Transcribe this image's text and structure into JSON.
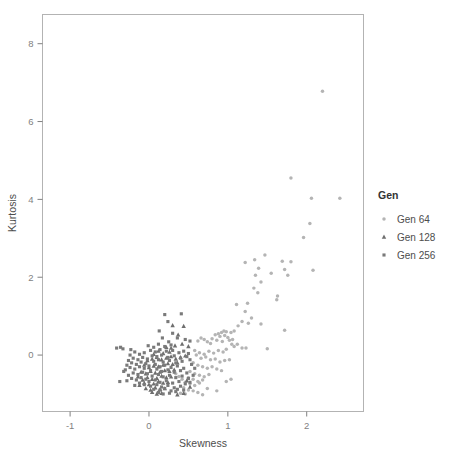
{
  "chart_data": {
    "type": "scatter",
    "title": "",
    "xlabel": "Skewness",
    "ylabel": "Kurtosis",
    "xlim": [
      -1.35,
      2.72
    ],
    "ylim": [
      -1.45,
      8.75
    ],
    "xticks": [
      -1,
      0,
      1,
      2
    ],
    "xticklabels": [
      "-1",
      "0",
      "1",
      "2"
    ],
    "yticks": [
      0,
      2,
      4,
      6,
      8
    ],
    "yticklabels": [
      "0",
      "2",
      "4",
      "6",
      "8"
    ],
    "grid": false,
    "legend": {
      "title": "Gen",
      "position": "right",
      "entries": [
        {
          "name": "Gen 64",
          "marker": "circle",
          "color": "#b4b4b4"
        },
        {
          "name": "Gen 128",
          "marker": "triangle",
          "color": "#6e6e6e"
        },
        {
          "name": "Gen 256",
          "marker": "square",
          "color": "#7a7a7a"
        }
      ]
    },
    "series": [
      {
        "name": "Gen 64",
        "marker": "circle",
        "color": "#b4b4b4",
        "points": [
          [
            2.2,
            6.78
          ],
          [
            1.8,
            4.55
          ],
          [
            2.06,
            4.03
          ],
          [
            2.42,
            4.03
          ],
          [
            2.04,
            3.38
          ],
          [
            1.96,
            3.02
          ],
          [
            2.08,
            2.18
          ],
          [
            1.47,
            2.57
          ],
          [
            1.34,
            2.45
          ],
          [
            1.22,
            2.38
          ],
          [
            1.69,
            2.41
          ],
          [
            1.8,
            2.4
          ],
          [
            1.72,
            2.2
          ],
          [
            1.76,
            2.05
          ],
          [
            1.39,
            2.23
          ],
          [
            1.35,
            2.05
          ],
          [
            1.55,
            2.1
          ],
          [
            1.42,
            1.88
          ],
          [
            1.33,
            1.72
          ],
          [
            1.38,
            1.6
          ],
          [
            1.63,
            1.52
          ],
          [
            1.62,
            1.42
          ],
          [
            1.11,
            1.3
          ],
          [
            1.25,
            1.33
          ],
          [
            1.22,
            1.12
          ],
          [
            1.3,
            0.95
          ],
          [
            1.26,
            0.82
          ],
          [
            1.42,
            0.8
          ],
          [
            1.18,
            0.86
          ],
          [
            1.13,
            0.75
          ],
          [
            1.72,
            0.64
          ],
          [
            1.08,
            0.62
          ],
          [
            1.04,
            0.58
          ],
          [
            0.98,
            0.6
          ],
          [
            0.95,
            0.62
          ],
          [
            0.92,
            0.58
          ],
          [
            0.88,
            0.55
          ],
          [
            0.84,
            0.52
          ],
          [
            0.9,
            0.48
          ],
          [
            0.96,
            0.5
          ],
          [
            1.0,
            0.45
          ],
          [
            1.02,
            0.38
          ],
          [
            1.06,
            0.4
          ],
          [
            0.93,
            0.35
          ],
          [
            0.86,
            0.38
          ],
          [
            0.8,
            0.42
          ],
          [
            0.78,
            0.3
          ],
          [
            0.74,
            0.34
          ],
          [
            0.7,
            0.4
          ],
          [
            0.66,
            0.44
          ],
          [
            0.62,
            0.36
          ],
          [
            1.05,
            0.28
          ],
          [
            1.08,
            0.22
          ],
          [
            1.12,
            0.28
          ],
          [
            1.18,
            0.18
          ],
          [
            1.23,
            0.18
          ],
          [
            1.5,
            0.16
          ],
          [
            0.98,
            0.15
          ],
          [
            0.94,
            0.08
          ],
          [
            0.88,
            0.12
          ],
          [
            0.82,
            0.05
          ],
          [
            0.76,
            0.1
          ],
          [
            0.7,
            0.02
          ],
          [
            0.64,
            0.06
          ],
          [
            0.58,
            0.12
          ],
          [
            0.6,
            0.0
          ],
          [
            0.66,
            -0.08
          ],
          [
            0.72,
            -0.05
          ],
          [
            0.78,
            -0.12
          ],
          [
            0.84,
            -0.1
          ],
          [
            0.9,
            -0.18
          ],
          [
            0.96,
            -0.14
          ],
          [
            1.02,
            -0.12
          ],
          [
            0.56,
            -0.2
          ],
          [
            0.62,
            -0.26
          ],
          [
            0.68,
            -0.3
          ],
          [
            0.74,
            -0.34
          ],
          [
            0.8,
            -0.3
          ],
          [
            0.86,
            -0.36
          ],
          [
            0.92,
            -0.4
          ],
          [
            0.52,
            -0.42
          ],
          [
            0.58,
            -0.48
          ],
          [
            0.64,
            -0.52
          ],
          [
            0.7,
            -0.56
          ],
          [
            0.76,
            -0.5
          ],
          [
            0.5,
            -0.58
          ],
          [
            0.56,
            -0.62
          ],
          [
            0.62,
            -0.68
          ],
          [
            0.68,
            -0.64
          ],
          [
            0.46,
            -0.7
          ],
          [
            0.52,
            -0.74
          ],
          [
            0.58,
            -0.78
          ],
          [
            0.64,
            -0.72
          ],
          [
            0.44,
            -0.84
          ],
          [
            0.5,
            -0.9
          ],
          [
            0.56,
            -0.92
          ],
          [
            0.62,
            -0.96
          ],
          [
            0.4,
            -0.98
          ],
          [
            0.46,
            -1.0
          ],
          [
            0.68,
            -1.02
          ],
          [
            0.74,
            -0.86
          ],
          [
            0.86,
            -0.92
          ],
          [
            0.98,
            -0.68
          ],
          [
            1.04,
            -0.62
          ],
          [
            0.42,
            -0.62
          ],
          [
            0.38,
            -0.55
          ],
          [
            0.34,
            -0.48
          ]
        ]
      },
      {
        "name": "Gen 128",
        "marker": "triangle",
        "color": "#6e6e6e",
        "points": [
          [
            0.3,
            0.76
          ],
          [
            0.44,
            0.74
          ],
          [
            0.37,
            0.52
          ],
          [
            0.42,
            0.28
          ],
          [
            0.5,
            0.22
          ],
          [
            0.33,
            0.24
          ],
          [
            0.28,
            0.18
          ],
          [
            0.22,
            0.2
          ],
          [
            0.46,
            -0.02
          ],
          [
            0.4,
            -0.06
          ],
          [
            0.34,
            -0.1
          ],
          [
            0.28,
            -0.04
          ],
          [
            0.22,
            -0.08
          ],
          [
            0.16,
            -0.12
          ],
          [
            0.1,
            -0.06
          ],
          [
            0.04,
            -0.1
          ],
          [
            -0.02,
            -0.14
          ],
          [
            0.36,
            -0.2
          ],
          [
            0.3,
            -0.24
          ],
          [
            0.24,
            -0.22
          ],
          [
            0.18,
            -0.26
          ],
          [
            0.12,
            -0.3
          ],
          [
            0.06,
            -0.28
          ],
          [
            0.0,
            -0.32
          ],
          [
            -0.06,
            -0.26
          ],
          [
            0.32,
            -0.38
          ],
          [
            0.26,
            -0.42
          ],
          [
            0.2,
            -0.4
          ],
          [
            0.14,
            -0.44
          ],
          [
            0.08,
            -0.46
          ],
          [
            0.02,
            -0.42
          ],
          [
            -0.04,
            -0.48
          ],
          [
            -0.1,
            -0.44
          ],
          [
            0.28,
            -0.56
          ],
          [
            0.22,
            -0.58
          ],
          [
            0.16,
            -0.54
          ],
          [
            0.1,
            -0.6
          ],
          [
            0.04,
            -0.62
          ],
          [
            -0.02,
            -0.58
          ],
          [
            -0.08,
            -0.64
          ],
          [
            -0.14,
            -0.56
          ],
          [
            0.24,
            -0.7
          ],
          [
            0.18,
            -0.72
          ],
          [
            0.12,
            -0.68
          ],
          [
            0.06,
            -0.74
          ],
          [
            0.0,
            -0.76
          ],
          [
            -0.06,
            -0.72
          ],
          [
            -0.12,
            -0.78
          ],
          [
            0.2,
            -0.86
          ],
          [
            0.14,
            -0.88
          ],
          [
            0.08,
            -0.84
          ],
          [
            0.02,
            -0.9
          ],
          [
            -0.04,
            -0.86
          ],
          [
            0.16,
            -0.98
          ],
          [
            0.1,
            -1.0
          ],
          [
            0.04,
            -0.96
          ],
          [
            0.36,
            -1.02
          ],
          [
            0.44,
            -0.98
          ],
          [
            0.52,
            -0.82
          ],
          [
            0.48,
            -0.66
          ],
          [
            0.26,
            0.08
          ],
          [
            0.18,
            0.04
          ],
          [
            0.12,
            0.1
          ],
          [
            0.06,
            0.02
          ]
        ]
      },
      {
        "name": "Gen 256",
        "marker": "square",
        "color": "#7a7a7a",
        "points": [
          [
            0.2,
            1.04
          ],
          [
            0.41,
            1.06
          ],
          [
            0.24,
            0.86
          ],
          [
            0.13,
            0.62
          ],
          [
            0.3,
            0.56
          ],
          [
            0.17,
            0.44
          ],
          [
            0.36,
            0.44
          ],
          [
            0.25,
            0.34
          ],
          [
            0.28,
            0.26
          ],
          [
            0.2,
            0.22
          ],
          [
            0.12,
            0.28
          ],
          [
            0.46,
            0.4
          ],
          [
            0.52,
            0.36
          ],
          [
            0.06,
            0.2
          ],
          [
            -0.01,
            0.24
          ],
          [
            -0.33,
            0.16
          ],
          [
            -0.41,
            0.18
          ],
          [
            -0.23,
            0.14
          ],
          [
            -0.36,
            0.2
          ],
          [
            0.02,
            0.12
          ],
          [
            0.08,
            0.08
          ],
          [
            0.14,
            0.14
          ],
          [
            0.22,
            0.1
          ],
          [
            0.3,
            0.12
          ],
          [
            0.38,
            0.06
          ],
          [
            0.44,
            0.1
          ],
          [
            0.5,
            0.04
          ],
          [
            -0.06,
            0.06
          ],
          [
            -0.12,
            0.02
          ],
          [
            -0.18,
            0.08
          ],
          [
            -0.24,
            0.0
          ],
          [
            0.04,
            -0.02
          ],
          [
            0.1,
            -0.04
          ],
          [
            0.16,
            0.0
          ],
          [
            0.24,
            -0.06
          ],
          [
            0.32,
            -0.02
          ],
          [
            0.4,
            -0.08
          ],
          [
            0.48,
            -0.04
          ],
          [
            -0.02,
            -0.1
          ],
          [
            -0.08,
            -0.06
          ],
          [
            -0.14,
            -0.12
          ],
          [
            -0.2,
            -0.08
          ],
          [
            -0.26,
            -0.14
          ],
          [
            0.06,
            -0.16
          ],
          [
            0.12,
            -0.12
          ],
          [
            0.18,
            -0.18
          ],
          [
            0.26,
            -0.14
          ],
          [
            0.34,
            -0.2
          ],
          [
            0.42,
            -0.16
          ],
          [
            0.52,
            -0.12
          ],
          [
            -0.04,
            -0.22
          ],
          [
            -0.1,
            -0.18
          ],
          [
            -0.16,
            -0.24
          ],
          [
            -0.22,
            -0.2
          ],
          [
            -0.28,
            -0.26
          ],
          [
            0.0,
            -0.28
          ],
          [
            0.08,
            -0.24
          ],
          [
            0.14,
            -0.3
          ],
          [
            0.2,
            -0.26
          ],
          [
            0.28,
            -0.32
          ],
          [
            0.36,
            -0.28
          ],
          [
            0.44,
            -0.34
          ],
          [
            0.54,
            -0.24
          ],
          [
            -0.06,
            -0.34
          ],
          [
            -0.12,
            -0.3
          ],
          [
            -0.18,
            -0.36
          ],
          [
            -0.24,
            -0.32
          ],
          [
            -0.3,
            -0.38
          ],
          [
            0.02,
            -0.4
          ],
          [
            0.1,
            -0.36
          ],
          [
            0.16,
            -0.42
          ],
          [
            0.24,
            -0.38
          ],
          [
            0.32,
            -0.44
          ],
          [
            0.4,
            -0.4
          ],
          [
            0.48,
            -0.46
          ],
          [
            -0.02,
            -0.48
          ],
          [
            -0.08,
            -0.44
          ],
          [
            -0.14,
            -0.5
          ],
          [
            -0.2,
            -0.46
          ],
          [
            -0.26,
            -0.52
          ],
          [
            -0.32,
            -0.42
          ],
          [
            0.04,
            -0.54
          ],
          [
            0.12,
            -0.5
          ],
          [
            0.18,
            -0.56
          ],
          [
            0.26,
            -0.52
          ],
          [
            0.34,
            -0.58
          ],
          [
            0.42,
            -0.54
          ],
          [
            0.5,
            -0.6
          ],
          [
            -0.04,
            -0.62
          ],
          [
            -0.1,
            -0.58
          ],
          [
            -0.16,
            -0.64
          ],
          [
            -0.22,
            -0.6
          ],
          [
            -0.28,
            -0.66
          ],
          [
            -0.37,
            -0.68
          ],
          [
            0.0,
            -0.68
          ],
          [
            0.08,
            -0.64
          ],
          [
            0.14,
            -0.7
          ],
          [
            0.22,
            -0.66
          ],
          [
            0.3,
            -0.72
          ],
          [
            0.38,
            -0.68
          ],
          [
            0.46,
            -0.74
          ],
          [
            -0.06,
            -0.76
          ],
          [
            -0.12,
            -0.72
          ],
          [
            -0.18,
            -0.78
          ],
          [
            0.02,
            -0.8
          ],
          [
            0.1,
            -0.76
          ],
          [
            0.16,
            -0.82
          ],
          [
            0.24,
            -0.78
          ],
          [
            0.32,
            -0.84
          ],
          [
            0.4,
            -0.8
          ],
          [
            0.06,
            -0.88
          ],
          [
            0.14,
            -0.9
          ],
          [
            0.2,
            -0.86
          ],
          [
            0.28,
            -0.92
          ],
          [
            0.36,
            -0.88
          ],
          [
            0.44,
            -0.9
          ],
          [
            0.12,
            -0.96
          ],
          [
            0.18,
            -1.0
          ],
          [
            0.26,
            -0.98
          ],
          [
            0.34,
            -0.94
          ],
          [
            0.52,
            -0.7
          ],
          [
            0.56,
            -0.52
          ],
          [
            0.58,
            -0.34
          ]
        ]
      }
    ]
  },
  "axes": {
    "x_title": "Skewness",
    "y_title": "Kurtosis"
  }
}
